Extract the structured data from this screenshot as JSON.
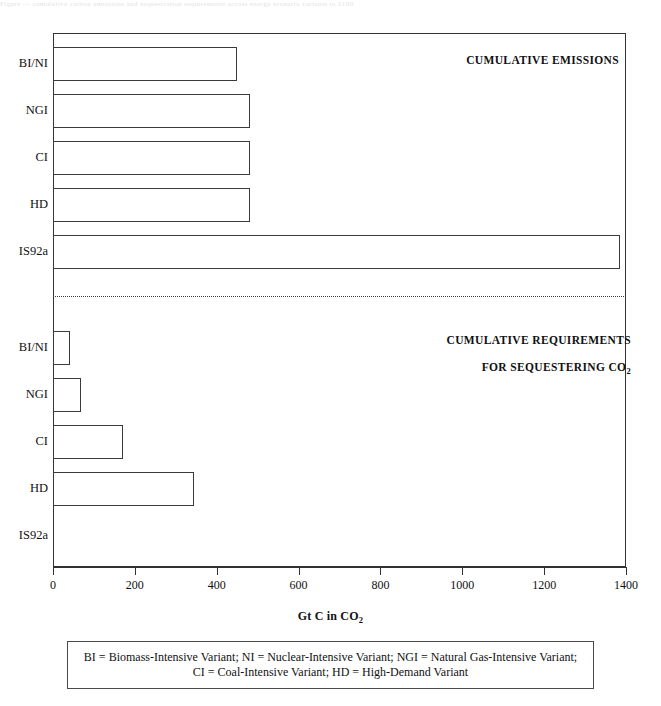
{
  "top_clip_text": "Figure — cumulative carbon emissions and sequestration requirements across energy scenario variants to 2100",
  "figure": {
    "panels": [
      {
        "id": "emissions",
        "title_line1": "CUMULATIVE EMISSIONS",
        "title_line2": ""
      },
      {
        "id": "sequestering",
        "title_line1": "CUMULATIVE REQUIREMENTS",
        "title_line2_prefix": "FOR SEQUESTERING CO",
        "title_line2_sub": "2"
      }
    ],
    "axis": {
      "title_prefix": "Gt C in CO",
      "title_sub": "2",
      "ticks": [
        0,
        200,
        400,
        600,
        800,
        1000,
        1200,
        1400
      ],
      "xlim": [
        0,
        1400
      ]
    },
    "note": "BI = Biomass-Intensive Variant; NI = Nuclear-Intensive Variant; NGI = Natural Gas-Intensive Variant;\nCI = Coal-Intensive Variant; HD = High-Demand Variant"
  },
  "chart_data": {
    "type": "bar",
    "orientation": "horizontal",
    "title": "",
    "xlabel": "Gt C in CO2",
    "ylabel": "",
    "xlim": [
      0,
      1400
    ],
    "grid": false,
    "legend": "none",
    "panels": [
      {
        "name": "CUMULATIVE EMISSIONS",
        "categories": [
          "BI/NI",
          "NGI",
          "CI",
          "HD",
          "IS92a"
        ],
        "values": [
          450,
          482,
          482,
          482,
          1385
        ]
      },
      {
        "name": "CUMULATIVE REQUIREMENTS FOR SEQUESTERING CO2",
        "categories": [
          "BI/NI",
          "NGI",
          "CI",
          "HD",
          "IS92a"
        ],
        "values": [
          42,
          69,
          170,
          344,
          0
        ]
      }
    ],
    "annotations": [
      "BI = Biomass-Intensive Variant",
      "NI = Nuclear-Intensive Variant",
      "NGI = Natural Gas-Intensive Variant",
      "CI = Coal-Intensive Variant",
      "HD = High-Demand Variant"
    ]
  }
}
